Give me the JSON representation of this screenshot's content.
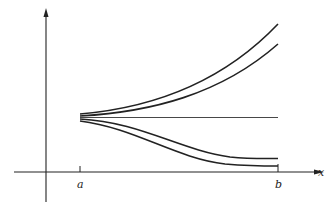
{
  "diagram": {
    "type": "solution-curves-sketch",
    "axes": {
      "x_label": "x",
      "x_ticks": [
        {
          "label": "a"
        },
        {
          "label": "b"
        }
      ]
    },
    "curves": [
      {
        "name": "curve-1",
        "description": "diverging upward, top"
      },
      {
        "name": "curve-2",
        "description": "diverging upward"
      },
      {
        "name": "curve-3",
        "description": "horizontal constant line"
      },
      {
        "name": "curve-4",
        "description": "decreasing, leveling off"
      },
      {
        "name": "curve-5",
        "description": "decreasing, leveling off, bottom"
      }
    ],
    "colors": {
      "line": "#222222",
      "background": "#ffffff"
    }
  }
}
